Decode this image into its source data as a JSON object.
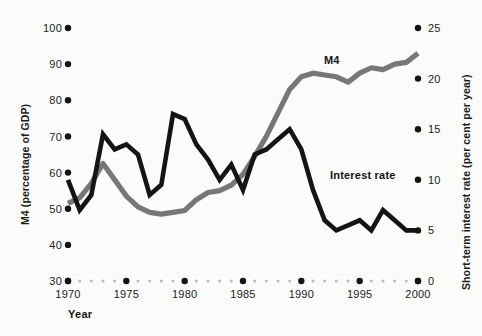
{
  "chart_data": {
    "type": "line",
    "title": "",
    "xlabel": "Year",
    "x": [
      1970,
      1971,
      1972,
      1973,
      1974,
      1975,
      1976,
      1977,
      1978,
      1979,
      1980,
      1981,
      1982,
      1983,
      1984,
      1985,
      1986,
      1987,
      1988,
      1989,
      1990,
      1991,
      1992,
      1993,
      1994,
      1995,
      1996,
      1997,
      1998,
      1999,
      2000
    ],
    "xlim": [
      1970,
      2000
    ],
    "xticks": [
      1970,
      1975,
      1980,
      1985,
      1990,
      1995,
      2000
    ],
    "xticklabels": [
      "1970",
      "1975",
      "1980",
      "1985",
      "1990",
      "1995",
      "2000"
    ],
    "grid": false,
    "legend_position": "inline-annotations",
    "axes": [
      {
        "id": "left",
        "label": "M4 (percentage of GDP)",
        "lim": [
          30,
          100
        ],
        "ticks": [
          30,
          40,
          50,
          60,
          70,
          80,
          90,
          100
        ],
        "ticklabels": [
          "30",
          "40",
          "50",
          "60",
          "70",
          "80",
          "90",
          "100"
        ]
      },
      {
        "id": "right",
        "label": "Short-term interest rate (per cent per year)",
        "lim": [
          0,
          25
        ],
        "ticks": [
          0,
          5,
          10,
          15,
          20,
          25
        ],
        "ticklabels": [
          "0",
          "5",
          "10",
          "15",
          "20",
          "25"
        ]
      }
    ],
    "series": [
      {
        "name": "M4",
        "axis": "left",
        "color": "#77777a",
        "unit": "percentage of GDP",
        "values": [
          51.5,
          53.0,
          57.0,
          62.5,
          58.0,
          53.5,
          50.5,
          49.0,
          48.5,
          49.0,
          49.5,
          52.5,
          54.5,
          55.0,
          56.5,
          59.5,
          64.5,
          70.0,
          76.5,
          83.0,
          86.5,
          87.5,
          87.0,
          86.5,
          85.0,
          87.5,
          89.0,
          88.5,
          90.0,
          90.5,
          93.0
        ]
      },
      {
        "name": "Interest rate",
        "axis": "right",
        "color": "#141414",
        "unit": "per cent per year",
        "values": [
          10.0,
          7.0,
          8.5,
          14.5,
          13.0,
          13.5,
          12.5,
          8.5,
          9.5,
          16.5,
          16.0,
          13.5,
          12.0,
          10.0,
          11.5,
          9.0,
          12.5,
          13.0,
          14.0,
          15.0,
          13.0,
          9.0,
          6.0,
          5.0,
          5.5,
          6.0,
          5.0,
          7.0,
          6.0,
          5.0,
          5.0
        ]
      }
    ],
    "annotations": [
      {
        "name": "m4-label",
        "text": "M4",
        "x": 1995,
        "series": "M4"
      },
      {
        "name": "interest-rate-label",
        "text": "Interest rate",
        "x": 1993,
        "series": "Interest rate"
      }
    ]
  }
}
